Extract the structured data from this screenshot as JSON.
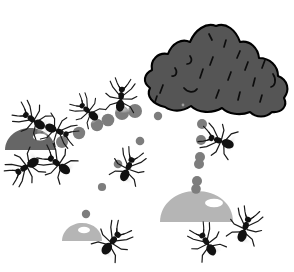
{
  "scene": {
    "title": "Ant colony foraging trail illustration",
    "width": 294,
    "height": 272,
    "background_color": "#ffffff",
    "top_caption": "· · · ·   · ·  · · · · · · · · · · · ·  · · ·",
    "caption_color": "#b9b9b9"
  },
  "palette": {
    "ant_body": "#111111",
    "ant_leg": "#1a1a1a",
    "rock_fill": "#555555",
    "rock_outline": "#000000",
    "rock_texture": "#0d0d0d",
    "pebble_dark": "#666666",
    "pebble_light": "#b5b5b5",
    "highlight": "#ffffff",
    "trail_dot": "#7d7d7d",
    "shadow": "#eaeaea"
  },
  "objects": {
    "rock": {
      "name": "large-rock",
      "label": "Rock / nest mound",
      "fill": "#555555",
      "outline": "#000000",
      "texture_marks": 16,
      "center_x": 215,
      "center_y": 68,
      "width": 140,
      "height": 85
    },
    "pebbles": [
      {
        "name": "pebble-dark-left",
        "fill": "#666666",
        "cx": 30,
        "cy": 139,
        "rx": 25,
        "ry": 11,
        "highlight": true
      },
      {
        "name": "pebble-light-center",
        "fill": "#b5b5b5",
        "cx": 196,
        "cy": 207,
        "rx": 36,
        "ry": 16,
        "highlight": true
      },
      {
        "name": "pebble-light-bottom-left",
        "fill": "#b5b5b5",
        "cx": 82,
        "cy": 232,
        "rx": 20,
        "ry": 9,
        "highlight": true
      }
    ],
    "trail_dots": {
      "name": "pheromone-trail-dots",
      "color": "#7d7d7d",
      "groups": [
        {
          "name": "upper-arc-trail",
          "points": [
            {
              "x": 62,
              "y": 142,
              "r": 6
            },
            {
              "x": 78,
              "y": 133,
              "r": 6
            },
            {
              "x": 96,
              "y": 125,
              "r": 6
            },
            {
              "x": 107,
              "y": 120,
              "r": 6
            },
            {
              "x": 122,
              "y": 114,
              "r": 7
            },
            {
              "x": 134,
              "y": 112,
              "r": 7
            },
            {
              "x": 157,
              "y": 116,
              "r": 4
            }
          ]
        },
        {
          "name": "diagonal-trail",
          "points": [
            {
              "x": 140,
              "y": 140,
              "r": 4
            },
            {
              "x": 118,
              "y": 164,
              "r": 4
            },
            {
              "x": 102,
              "y": 186,
              "r": 4
            },
            {
              "x": 86,
              "y": 214,
              "r": 4
            }
          ]
        },
        {
          "name": "vertical-right-trail",
          "points": [
            {
              "x": 201,
              "y": 124,
              "r": 5
            },
            {
              "x": 201,
              "y": 140,
              "r": 5
            },
            {
              "x": 200,
              "y": 158,
              "r": 5
            },
            {
              "x": 199,
              "y": 164,
              "r": 5
            },
            {
              "x": 197,
              "y": 183,
              "r": 5
            },
            {
              "x": 196,
              "y": 189,
              "r": 5
            }
          ]
        }
      ]
    },
    "ants": [
      {
        "name": "ant-upper-left-1",
        "x": 33,
        "y": 120,
        "scale": 0.8,
        "rotation": -55
      },
      {
        "name": "ant-upper-left-2",
        "x": 57,
        "y": 130,
        "scale": 0.78,
        "rotation": 110
      },
      {
        "name": "ant-lower-left-1",
        "x": 27,
        "y": 166,
        "scale": 0.82,
        "rotation": -120
      },
      {
        "name": "ant-lower-left-2",
        "x": 57,
        "y": 163,
        "scale": 0.82,
        "rotation": -55
      },
      {
        "name": "ant-midway-upper",
        "x": 88,
        "y": 111,
        "scale": 0.72,
        "rotation": -48
      },
      {
        "name": "ant-near-rock-top",
        "x": 120,
        "y": 98,
        "scale": 0.78,
        "rotation": 8
      },
      {
        "name": "ant-center",
        "x": 128,
        "y": 167,
        "scale": 0.8,
        "rotation": 25
      },
      {
        "name": "ant-right-of-rock",
        "x": 220,
        "y": 141,
        "scale": 0.82,
        "rotation": -70
      },
      {
        "name": "ant-bottom-left",
        "x": 112,
        "y": 242,
        "scale": 0.84,
        "rotation": 38
      },
      {
        "name": "ant-bottom-center",
        "x": 207,
        "y": 243,
        "scale": 0.8,
        "rotation": -35
      },
      {
        "name": "ant-bottom-right",
        "x": 244,
        "y": 228,
        "scale": 0.82,
        "rotation": 18
      }
    ]
  }
}
